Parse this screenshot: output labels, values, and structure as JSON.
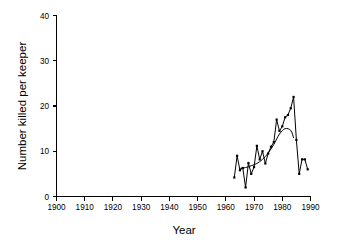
{
  "chart_data": {
    "type": "line",
    "title": "",
    "xlabel": "Year",
    "ylabel": "Number killed per keeper",
    "xlim": [
      1900,
      1990
    ],
    "ylim": [
      0,
      40
    ],
    "xticks": [
      1900,
      1910,
      1920,
      1930,
      1940,
      1950,
      1960,
      1970,
      1980,
      1990
    ],
    "xtick_labels": [
      "1900",
      "1910",
      "1920",
      "1930",
      "1940",
      "1950",
      "1960",
      "1970",
      "1980",
      "1990"
    ],
    "yticks": [
      0,
      10,
      20,
      30,
      40
    ],
    "ytick_labels": [
      "0",
      "10",
      "20",
      "30",
      "40"
    ],
    "grid": false,
    "legend": false,
    "legend_position": "none",
    "frame": "left-bottom-spines-only",
    "series": [
      {
        "name": "Number killed per keeper",
        "style": "jagged-line-with-square-markers",
        "marker": "square",
        "color": "#000000",
        "x": [
          1963,
          1964,
          1965,
          1966,
          1967,
          1968,
          1969,
          1970,
          1971,
          1972,
          1973,
          1974,
          1975,
          1976,
          1977,
          1978,
          1979,
          1980,
          1981,
          1982,
          1983,
          1984,
          1985,
          1986,
          1987,
          1988,
          1989
        ],
        "values": [
          4.2,
          9.0,
          5.8,
          6.3,
          2.0,
          7.4,
          5.0,
          6.5,
          11.2,
          8.2,
          10.0,
          7.3,
          9.5,
          11.0,
          12.0,
          17.0,
          14.5,
          15.5,
          17.5,
          18.0,
          19.5,
          22.0,
          12.5,
          5.0,
          8.2,
          8.2,
          6.0
        ]
      },
      {
        "name": "Smoothed trend",
        "style": "smooth-trend-curve",
        "marker": "none",
        "color": "#000000",
        "x": [
          1965,
          1967,
          1969,
          1971,
          1973,
          1975,
          1977,
          1979,
          1981,
          1983,
          1984
        ],
        "values": [
          6.2,
          6.4,
          6.8,
          7.3,
          8.2,
          9.6,
          11.5,
          13.8,
          15.0,
          14.6,
          13.0
        ]
      }
    ],
    "annotations": []
  },
  "axis_titles": {
    "x": "Year",
    "y": "Number killed per keeper"
  }
}
